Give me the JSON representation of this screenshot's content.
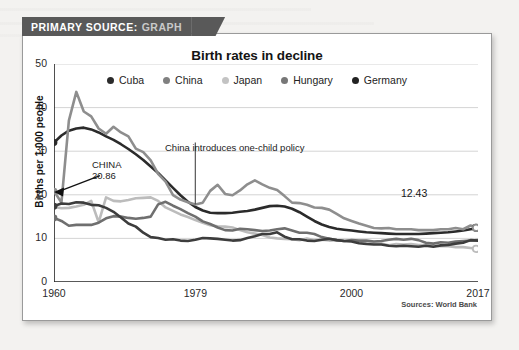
{
  "banner": {
    "prefix": "PRIMARY SOURCE:",
    "suffix": "GRAPH",
    "bg_color": "#595959"
  },
  "chart_data": {
    "type": "line",
    "title": "Birth rates in decline",
    "xlabel": "",
    "ylabel": "Births per 1,000 people",
    "xlim": [
      1960,
      2017
    ],
    "ylim": [
      0,
      50
    ],
    "yticks": [
      50,
      40,
      30,
      20,
      10,
      0
    ],
    "xticks": [
      1960,
      1979,
      2000,
      2017
    ],
    "grid": true,
    "legend_position": "top-center",
    "source": "Sources: World Bank",
    "annotations": [
      {
        "name": "china-start-label",
        "text_line1": "CHINA",
        "text_line2": "20.86",
        "points_to_year": 1960,
        "points_to_value": 20.86
      },
      {
        "name": "one-child-policy-label",
        "text": "China introduces one-child policy",
        "points_to_year": 1979
      },
      {
        "name": "cuba-end-value-label",
        "text": "12.43",
        "points_to_year": 2017,
        "points_to_value": 12.43
      }
    ],
    "x": [
      1960,
      1961,
      1962,
      1963,
      1964,
      1965,
      1966,
      1967,
      1968,
      1969,
      1970,
      1971,
      1972,
      1973,
      1974,
      1975,
      1976,
      1977,
      1978,
      1979,
      1980,
      1981,
      1982,
      1983,
      1984,
      1985,
      1986,
      1987,
      1988,
      1989,
      1990,
      1991,
      1992,
      1993,
      1994,
      1995,
      1996,
      1997,
      1998,
      1999,
      2000,
      2001,
      2002,
      2003,
      2004,
      2005,
      2006,
      2007,
      2008,
      2009,
      2010,
      2011,
      2012,
      2013,
      2014,
      2015,
      2016,
      2017
    ],
    "series": [
      {
        "name": "Cuba",
        "color": "#2b2b2b",
        "legend_dot_color": "#2b2b2b",
        "end_marker": true,
        "values": [
          32.0,
          33.6,
          34.7,
          35.2,
          35.4,
          35.0,
          34.3,
          33.4,
          32.6,
          31.6,
          30.5,
          29.3,
          28.0,
          26.5,
          25.0,
          23.3,
          21.6,
          19.9,
          18.4,
          17.2,
          16.4,
          15.9,
          15.8,
          15.8,
          15.9,
          16.1,
          16.3,
          16.6,
          17.0,
          17.4,
          17.5,
          17.3,
          16.8,
          16.0,
          15.0,
          14.0,
          13.2,
          12.6,
          12.2,
          12.0,
          11.8,
          11.6,
          11.4,
          11.3,
          11.2,
          11.1,
          11.0,
          11.0,
          11.0,
          11.0,
          11.1,
          11.2,
          11.3,
          11.4,
          11.6,
          11.8,
          12.1,
          12.43
        ]
      },
      {
        "name": "China",
        "color": "#8e8e8e",
        "legend_dot_color": "#808080",
        "end_marker": true,
        "values": [
          20.86,
          18.2,
          37.0,
          43.6,
          39.1,
          38.0,
          35.2,
          34.0,
          35.6,
          34.3,
          33.4,
          30.6,
          29.8,
          27.9,
          24.8,
          23.0,
          19.9,
          18.9,
          18.3,
          17.8,
          18.2,
          20.9,
          22.3,
          20.2,
          19.9,
          21.0,
          22.4,
          23.3,
          22.4,
          21.6,
          21.1,
          19.7,
          18.2,
          18.1,
          17.7,
          17.1,
          17.0,
          16.6,
          15.6,
          14.6,
          14.0,
          13.4,
          12.9,
          12.4,
          12.3,
          12.4,
          12.1,
          12.1,
          12.1,
          11.9,
          11.9,
          11.9,
          12.1,
          12.1,
          12.4,
          12.1,
          12.95,
          12.43
        ]
      },
      {
        "name": "Japan",
        "color": "#bcbcbc",
        "legend_dot_color": "#c3c3c3",
        "end_marker": true,
        "values": [
          17.2,
          16.9,
          17.0,
          17.3,
          17.7,
          18.6,
          13.7,
          19.4,
          18.6,
          18.5,
          18.8,
          19.2,
          19.3,
          19.4,
          18.6,
          17.1,
          16.3,
          15.5,
          14.9,
          14.2,
          13.6,
          13.0,
          12.8,
          12.7,
          12.5,
          11.9,
          11.4,
          11.1,
          10.8,
          10.2,
          10.0,
          9.9,
          9.8,
          9.6,
          10.0,
          9.6,
          9.7,
          9.5,
          9.6,
          9.4,
          9.5,
          9.3,
          9.2,
          8.9,
          8.8,
          8.4,
          8.7,
          8.6,
          8.7,
          8.5,
          8.5,
          8.3,
          8.2,
          8.2,
          8.0,
          8.0,
          7.8,
          7.6
        ]
      },
      {
        "name": "Hungary",
        "color": "#6f6f6f",
        "legend_dot_color": "#777777",
        "end_marker": false,
        "values": [
          14.7,
          14.0,
          12.9,
          13.1,
          13.1,
          13.1,
          13.6,
          14.6,
          15.1,
          15.0,
          14.7,
          14.5,
          14.7,
          15.0,
          17.8,
          18.4,
          17.5,
          16.7,
          15.8,
          15.0,
          13.9,
          13.3,
          12.5,
          11.9,
          11.8,
          12.2,
          12.1,
          11.9,
          11.7,
          11.8,
          12.1,
          12.3,
          11.8,
          11.3,
          11.3,
          11.0,
          10.3,
          9.9,
          9.6,
          9.4,
          9.6,
          9.5,
          9.5,
          9.3,
          9.4,
          9.7,
          9.9,
          9.7,
          9.9,
          9.6,
          9.0,
          8.8,
          9.1,
          9.0,
          9.3,
          9.4,
          9.5,
          9.6
        ]
      },
      {
        "name": "Germany",
        "color": "#3d3d3d",
        "legend_dot_color": "#222222",
        "end_marker": false,
        "values": [
          17.4,
          18.0,
          17.9,
          18.3,
          18.2,
          17.7,
          17.6,
          17.0,
          16.1,
          14.8,
          13.4,
          12.7,
          11.3,
          10.3,
          10.1,
          9.7,
          9.8,
          9.5,
          9.4,
          9.7,
          10.1,
          10.0,
          9.9,
          9.7,
          9.5,
          9.6,
          10.1,
          10.5,
          11.0,
          11.0,
          11.4,
          10.4,
          9.8,
          9.8,
          9.5,
          9.4,
          9.7,
          9.9,
          9.6,
          9.4,
          9.3,
          8.9,
          8.7,
          8.6,
          8.6,
          8.3,
          8.2,
          8.3,
          8.2,
          8.1,
          8.3,
          8.1,
          8.4,
          8.5,
          8.8,
          9.0,
          9.6,
          9.5
        ]
      }
    ]
  }
}
